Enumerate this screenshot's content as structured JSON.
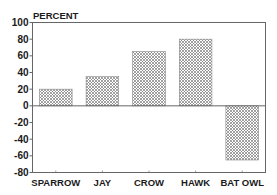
{
  "chart_data": {
    "type": "bar",
    "title": "",
    "ylabel": "PERCENT",
    "xlabel": "",
    "categories": [
      "SPARROW",
      "JAY",
      "CROW",
      "HAWK",
      "BAT OWL"
    ],
    "values": [
      20,
      35,
      65,
      80,
      -65
    ],
    "ylim": [
      -80,
      100
    ],
    "yticks": [
      100,
      80,
      60,
      40,
      20,
      0,
      -20,
      -40,
      -60,
      -80
    ],
    "ytick_labels": [
      "100",
      "80",
      "60",
      "40",
      "20",
      "0",
      "-20",
      "-40",
      "-60",
      "-80"
    ],
    "grid": false,
    "legend": "none",
    "bar_fill": "crosshatch",
    "colors": {
      "bar_pattern": "#8a8a8a",
      "axis": "#555555",
      "text": "#1a1a1a"
    }
  }
}
